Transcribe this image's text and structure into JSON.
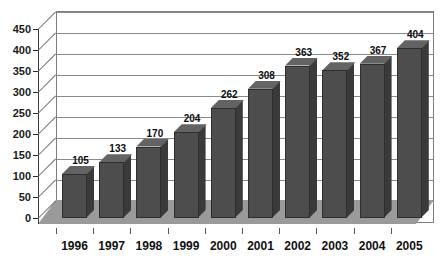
{
  "chart_data": {
    "type": "bar",
    "title": "",
    "subtitle": "",
    "xlabel": "",
    "ylabel": "",
    "categories": [
      "1996",
      "1997",
      "1998",
      "1999",
      "2000",
      "2001",
      "2002",
      "2003",
      "2004",
      "2005"
    ],
    "values": [
      105,
      133,
      170,
      204,
      262,
      308,
      363,
      352,
      367,
      404
    ],
    "ylim": [
      0,
      450
    ],
    "ytick_step": 50,
    "ytick_labels": [
      "450",
      "400",
      "350",
      "300",
      "250",
      "200",
      "150",
      "100",
      "50",
      "0"
    ],
    "ytick_values": [
      450,
      400,
      350,
      300,
      250,
      200,
      150,
      100,
      50,
      0
    ],
    "grid": true,
    "grid_axis": "y",
    "legend": false,
    "legend_position": "none",
    "style": "3d-column",
    "data_labels": true,
    "colors": {
      "bar_front": "#4d4d4d",
      "bar_side": "#3a3a3a",
      "bar_top": "#636363",
      "floor": "#9a9a9a",
      "wall": "#ffffff",
      "gridline": "#8a8a8a",
      "frame": "#7d7d7d",
      "text": "#111111"
    }
  }
}
